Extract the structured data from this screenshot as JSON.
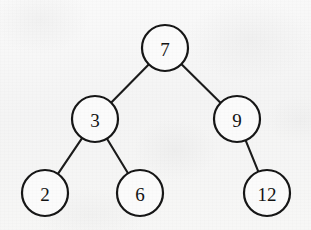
{
  "diagram": {
    "kind": "binary-search-tree",
    "background_color": "#f6f6f6",
    "stroke_color": "#161616",
    "node_fill_color": "#fbfbfb",
    "node_radius": 23,
    "nodes": [
      {
        "id": "n7",
        "label": "7",
        "cx": 165,
        "cy": 48,
        "r": 23
      },
      {
        "id": "n3",
        "label": "3",
        "cx": 95,
        "cy": 119,
        "r": 23
      },
      {
        "id": "n9",
        "label": "9",
        "cx": 237,
        "cy": 119,
        "r": 23
      },
      {
        "id": "n2",
        "label": "2",
        "cx": 45,
        "cy": 193,
        "r": 23
      },
      {
        "id": "n6",
        "label": "6",
        "cx": 140,
        "cy": 193,
        "r": 23
      },
      {
        "id": "n12",
        "label": "12",
        "cx": 267,
        "cy": 193,
        "r": 23
      }
    ],
    "edges": [
      {
        "id": "e7-3",
        "from": "n7",
        "to": "n3"
      },
      {
        "id": "e7-9",
        "from": "n7",
        "to": "n9"
      },
      {
        "id": "e3-2",
        "from": "n3",
        "to": "n2"
      },
      {
        "id": "e3-6",
        "from": "n3",
        "to": "n6"
      },
      {
        "id": "e9-12",
        "from": "n9",
        "to": "n12"
      }
    ]
  },
  "chart_data": {
    "type": "diagram",
    "title": "",
    "structure": "binary search tree",
    "root": "7",
    "values": [
      7,
      3,
      9,
      2,
      6,
      12
    ],
    "adjacency": {
      "7": {
        "left": "3",
        "right": "9"
      },
      "3": {
        "left": "2",
        "right": "6"
      },
      "9": {
        "left": null,
        "right": "12"
      },
      "2": {
        "left": null,
        "right": null
      },
      "6": {
        "left": null,
        "right": null
      },
      "12": {
        "left": null,
        "right": null
      }
    },
    "levels": [
      [
        "7"
      ],
      [
        "3",
        "9"
      ],
      [
        "2",
        "6",
        "12"
      ]
    ]
  }
}
